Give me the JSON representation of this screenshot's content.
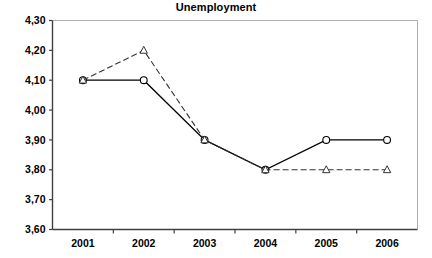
{
  "chart_data": {
    "type": "line",
    "title": "Unemployment",
    "xlabel": "",
    "ylabel": "",
    "categories": [
      "2001",
      "2002",
      "2003",
      "2004",
      "2005",
      "2006"
    ],
    "series": [
      {
        "name": "series-1-solid-circles",
        "marker": "open-circle",
        "line_style": "solid",
        "color": "#000000",
        "values": [
          4.1,
          4.1,
          3.9,
          3.8,
          3.9,
          3.9
        ]
      },
      {
        "name": "series-2-dashed-triangles",
        "marker": "open-triangle",
        "line_style": "dashed",
        "color": "#333333",
        "values": [
          4.1,
          4.2,
          3.9,
          3.8,
          3.8,
          3.8
        ]
      }
    ],
    "ylim": [
      3.6,
      4.3
    ],
    "ystep": 0.1,
    "ytick_labels": [
      "4,30",
      "4,20",
      "4,10",
      "4,00",
      "3,90",
      "3,80",
      "3,70",
      "3,60"
    ],
    "ytick_values": [
      4.3,
      4.2,
      4.1,
      4.0,
      3.9,
      3.8,
      3.7,
      3.6
    ],
    "decimal_separator": ",",
    "grid": false,
    "legend": "none",
    "axis_color": "#404040",
    "frame_color": "#b0b0b0"
  }
}
